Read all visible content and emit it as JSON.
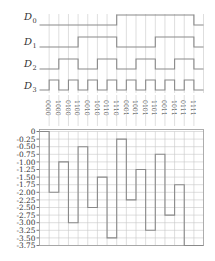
{
  "signals": [
    {
      "name": "D",
      "sub": "0",
      "bits": [
        0,
        0,
        0,
        0,
        0,
        0,
        0,
        0,
        1,
        1,
        1,
        1,
        1,
        1,
        1,
        1
      ]
    },
    {
      "name": "D",
      "sub": "1",
      "bits": [
        0,
        0,
        0,
        0,
        1,
        1,
        1,
        1,
        0,
        0,
        0,
        0,
        1,
        1,
        1,
        1
      ]
    },
    {
      "name": "D",
      "sub": "2",
      "bits": [
        0,
        0,
        1,
        1,
        0,
        0,
        1,
        1,
        0,
        0,
        1,
        1,
        0,
        0,
        1,
        1
      ]
    },
    {
      "name": "D",
      "sub": "3",
      "bits": [
        0,
        1,
        0,
        1,
        0,
        1,
        0,
        1,
        0,
        1,
        0,
        1,
        0,
        1,
        0,
        1
      ]
    }
  ],
  "codes": [
    "0000",
    "1000",
    "0100",
    "1100",
    "0010",
    "1010",
    "0110",
    "1110",
    "0001",
    "1001",
    "0101",
    "1101",
    "0011",
    "1011",
    "0111",
    "1111"
  ],
  "chart_data": {
    "type": "line",
    "title": "",
    "xlabel": "",
    "ylabel": "",
    "categories": [
      "0000",
      "1000",
      "0100",
      "1100",
      "0010",
      "1010",
      "0110",
      "1110",
      "0001",
      "1001",
      "0101",
      "1101",
      "0011",
      "1011",
      "0111",
      "1111"
    ],
    "values": [
      0,
      -2.0,
      -1.0,
      -3.0,
      -0.5,
      -2.5,
      -1.5,
      -3.5,
      -0.25,
      -2.25,
      -1.25,
      -3.25,
      -0.75,
      -2.75,
      -1.75,
      -3.75
    ],
    "yticks": [
      "0",
      "-0.25",
      "-0.50",
      "-0.75",
      "-1.00",
      "-1.25",
      "-1.50",
      "-1.75",
      "-2.00",
      "-2.25",
      "-2.50",
      "-2.75",
      "-3.00",
      "-3.25",
      "-3.50",
      "-3.75"
    ],
    "ylim": [
      -3.75,
      0
    ],
    "grid": true,
    "step": true
  },
  "colors": {
    "wave": "#8a8a8a",
    "grid": "#c8c8c8",
    "text": "#333333"
  }
}
